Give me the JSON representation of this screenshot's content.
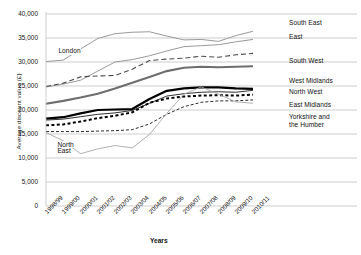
{
  "chart_data": {
    "type": "line",
    "title": "",
    "xlabel": "Years",
    "ylabel": "Average discount value (£)",
    "ylim": [
      0,
      40000
    ],
    "ytick_labels": [
      "40,000",
      "35,000",
      "30,000",
      "25,000",
      "20,000",
      "15,000",
      "10,000",
      "5,000",
      "0"
    ],
    "ytick_values": [
      40000,
      35000,
      30000,
      25000,
      20000,
      15000,
      10000,
      5000,
      0
    ],
    "grid": true,
    "legend_position": "right",
    "categories": [
      "1998/99",
      "1999/00",
      "2000/01",
      "2001/02",
      "2002/03",
      "2003/04",
      "2004/05",
      "2005/06",
      "2006/07",
      "2007/08",
      "2008/09",
      "2009/10",
      "2010/11"
    ],
    "series": [
      {
        "name": "London",
        "style": "solid-thin-gray",
        "color": "#9a9a9a",
        "values": [
          30100,
          30400,
          32700,
          34900,
          35900,
          36200,
          36300,
          35400,
          34600,
          34700,
          34300,
          35500,
          36400
        ]
      },
      {
        "name": "South East",
        "style": "solid-thin-gray",
        "color": "#9a9a9a",
        "values": [
          24800,
          25400,
          26200,
          28100,
          30000,
          30500,
          31300,
          32300,
          33200,
          33400,
          33600,
          34200,
          34700
        ]
      },
      {
        "name": "East",
        "style": "dashed-gray",
        "color": "#4a4a4a",
        "values": [
          24900,
          25600,
          26900,
          27100,
          27200,
          28500,
          30300,
          30600,
          30800,
          31200,
          31000,
          31500,
          31800
        ]
      },
      {
        "name": "South West",
        "style": "solid-thick-gray",
        "color": "#6e6e6e",
        "values": [
          21300,
          21900,
          22600,
          23400,
          24500,
          25700,
          26900,
          28100,
          28800,
          29000,
          28900,
          29000,
          29100
        ]
      },
      {
        "name": "West Midlands",
        "style": "solid-thick-black",
        "color": "#000000",
        "values": [
          18200,
          18500,
          19300,
          20000,
          20100,
          20200,
          22300,
          24000,
          24500,
          24700,
          24700,
          24500,
          24400
        ]
      },
      {
        "name": "North West",
        "style": "solid-thin-black",
        "color": "#1a1a1a",
        "values": [
          17900,
          18100,
          18600,
          19100,
          19400,
          19900,
          21400,
          22900,
          23400,
          23700,
          23800,
          23700,
          24100
        ]
      },
      {
        "name": "East Midlands",
        "style": "dotted-bold-black",
        "color": "#000000",
        "values": [
          16800,
          17000,
          17600,
          18300,
          18800,
          19500,
          21500,
          22400,
          22800,
          23000,
          23100,
          23000,
          23200
        ]
      },
      {
        "name": "Yorkshire and the Humber",
        "style": "dashed-fine-black",
        "color": "#2a2a2a",
        "values": [
          15500,
          15500,
          15500,
          15600,
          15700,
          15900,
          17100,
          19100,
          20700,
          21600,
          21900,
          21900,
          22100
        ]
      },
      {
        "name": "North East",
        "style": "solid-thin-lightgray",
        "color": "#a8a8a8",
        "values": [
          15300,
          13600,
          10900,
          11900,
          12600,
          12100,
          14900,
          19300,
          23300,
          24800,
          23300,
          21700,
          21400
        ]
      }
    ],
    "inline_labels": [
      {
        "text": "London",
        "x": 0.06,
        "value": 32200
      },
      {
        "text": "North",
        "x": 0.055,
        "value": 12800
      },
      {
        "text": "East",
        "x": 0.055,
        "value": 11400
      }
    ],
    "legend_entries": [
      {
        "label": "South East"
      },
      {
        "label": "East"
      },
      {
        "label": "South West"
      },
      {
        "label": "West Midlands"
      },
      {
        "label": "North West"
      },
      {
        "label": "East Midlands"
      },
      {
        "label": "Yorkshire and"
      },
      {
        "label": "the Humber"
      }
    ]
  }
}
